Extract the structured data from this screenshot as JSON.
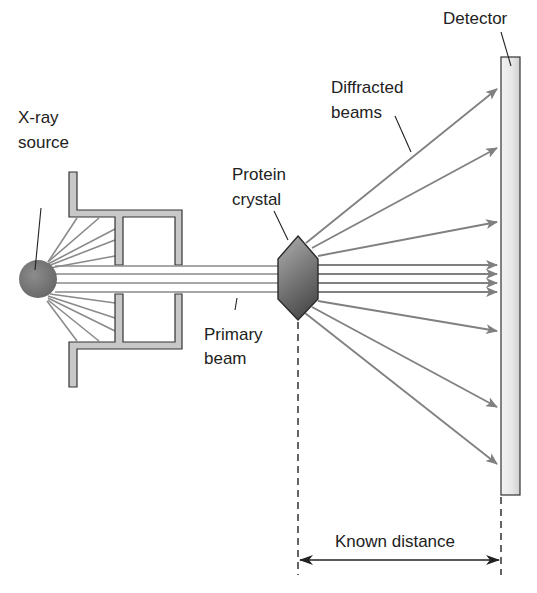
{
  "labels": {
    "xray_source_line1": "X-ray",
    "xray_source_line2": "source",
    "protein_crystal_line1": "Protein",
    "protein_crystal_line2": "crystal",
    "diffracted_line1": "Diffracted",
    "diffracted_line2": "beams",
    "detector": "Detector",
    "primary_line1": "Primary",
    "primary_line2": "beam",
    "known_distance": "Known distance"
  },
  "colors": {
    "beam": "#808080",
    "housing_fill": "#c8c8c8",
    "source_fill": "#7a7a7a",
    "crystal_dark": "#5a5a5a",
    "crystal_light": "#a8a8a8",
    "detector_fill": "#e4e4e4",
    "outline": "#333333"
  }
}
